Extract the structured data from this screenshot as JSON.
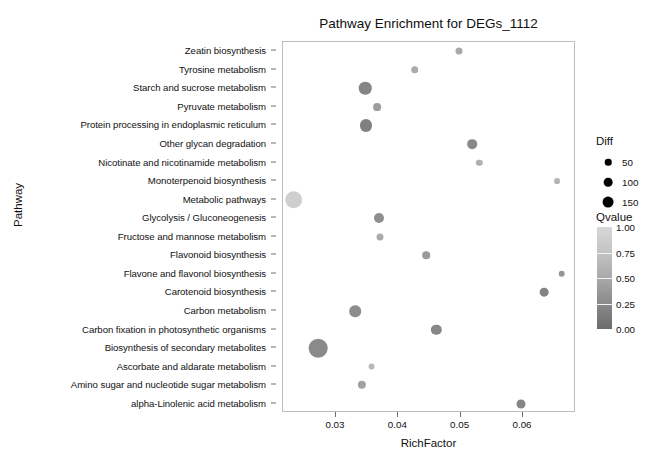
{
  "chart_data": {
    "type": "scatter",
    "title": "Pathway Enrichment for DEGs_1112",
    "xlabel": "RichFactor",
    "ylabel": "Pathway",
    "xlim": [
      0.0215,
      0.0685
    ],
    "xticks": [
      0.03,
      0.04,
      0.05,
      0.06
    ],
    "xtick_labels": [
      "0.03",
      "0.04",
      "0.05",
      "0.06"
    ],
    "grid": false,
    "legend_position": "right",
    "size_legend": {
      "title": "Diff",
      "breaks": [
        50,
        100,
        150
      ],
      "labels": [
        "50",
        "100",
        "150"
      ]
    },
    "color_legend": {
      "title": "Qvalue",
      "ticks": [
        1.0,
        0.75,
        0.5,
        0.25,
        0.0
      ],
      "tick_labels": [
        "1.00",
        "0.75",
        "0.50",
        "0.25",
        "0.00"
      ],
      "low_color": "#6b6b6b",
      "high_color": "#d8d8d8"
    },
    "categories": [
      "Zeatin biosynthesis",
      "Tyrosine metabolism",
      "Starch and sucrose metabolism",
      "Pyruvate metabolism",
      "Protein processing in endoplasmic reticulum",
      "Other glycan degradation",
      "Nicotinate and nicotinamide metabolism",
      "Monoterpenoid biosynthesis",
      "Metabolic pathways",
      "Glycolysis / Gluconeogenesis",
      "Fructose and mannose metabolism",
      "Flavonoid biosynthesis",
      "Flavone and flavonol biosynthesis",
      "Carotenoid biosynthesis",
      "Carbon metabolism",
      "Carbon fixation in photosynthetic organisms",
      "Biosynthesis of secondary metabolites",
      "Ascorbate and aldarate metabolism",
      "Amino sugar and nucleotide sugar metabolism",
      "alpha-Linolenic acid metabolism"
    ],
    "points": [
      {
        "pathway": "Zeatin biosynthesis",
        "richfactor": 0.0498,
        "diff": 10,
        "qvalue": 0.52,
        "color": "#a8a8a8"
      },
      {
        "pathway": "Tyrosine metabolism",
        "richfactor": 0.0426,
        "diff": 13,
        "qvalue": 0.58,
        "color": "#ababab"
      },
      {
        "pathway": "Starch and sucrose metabolism",
        "richfactor": 0.0347,
        "diff": 55,
        "qvalue": 0.22,
        "color": "#858585"
      },
      {
        "pathway": "Pyruvate metabolism",
        "richfactor": 0.0366,
        "diff": 14,
        "qvalue": 0.45,
        "color": "#9d9d9d"
      },
      {
        "pathway": "Protein processing in endoplasmic reticulum",
        "richfactor": 0.0348,
        "diff": 50,
        "qvalue": 0.18,
        "color": "#808080"
      },
      {
        "pathway": "Other glycan degradation",
        "richfactor": 0.0518,
        "diff": 27,
        "qvalue": 0.25,
        "color": "#888888"
      },
      {
        "pathway": "Nicotinate and nicotinamide metabolism",
        "richfactor": 0.053,
        "diff": 7,
        "qvalue": 0.6,
        "color": "#b0b0b0"
      },
      {
        "pathway": "Monoterpenoid biosynthesis",
        "richfactor": 0.0654,
        "diff": 5,
        "qvalue": 0.65,
        "color": "#b5b5b5"
      },
      {
        "pathway": "Metabolic pathways",
        "richfactor": 0.0232,
        "diff": 130,
        "qvalue": 0.88,
        "color": "#cfcfcf"
      },
      {
        "pathway": "Glycolysis / Gluconeogenesis",
        "richfactor": 0.0369,
        "diff": 30,
        "qvalue": 0.3,
        "color": "#8e8e8e"
      },
      {
        "pathway": "Fructose and mannose metabolism",
        "richfactor": 0.037,
        "diff": 10,
        "qvalue": 0.55,
        "color": "#aaaaaa"
      },
      {
        "pathway": "Flavonoid biosynthesis",
        "richfactor": 0.0445,
        "diff": 13,
        "qvalue": 0.42,
        "color": "#9a9a9a"
      },
      {
        "pathway": "Flavone and flavonol biosynthesis",
        "richfactor": 0.0662,
        "diff": 8,
        "qvalue": 0.38,
        "color": "#959595"
      },
      {
        "pathway": "Carotenoid biosynthesis",
        "richfactor": 0.0634,
        "diff": 20,
        "qvalue": 0.2,
        "color": "#838383"
      },
      {
        "pathway": "Carbon metabolism",
        "richfactor": 0.0331,
        "diff": 45,
        "qvalue": 0.28,
        "color": "#8c8c8c"
      },
      {
        "pathway": "Carbon fixation in photosynthetic organisms",
        "richfactor": 0.0461,
        "diff": 33,
        "qvalue": 0.24,
        "color": "#878787"
      },
      {
        "pathway": "Biosynthesis of secondary metabolites",
        "richfactor": 0.0271,
        "diff": 150,
        "qvalue": 0.26,
        "color": "#8a8a8a"
      },
      {
        "pathway": "Ascorbate and aldarate metabolism",
        "richfactor": 0.0357,
        "diff": 9,
        "qvalue": 0.68,
        "color": "#b8b8b8"
      },
      {
        "pathway": "Amino sugar and nucleotide sugar metabolism",
        "richfactor": 0.0342,
        "diff": 17,
        "qvalue": 0.5,
        "color": "#a2a2a2"
      },
      {
        "pathway": "alpha-Linolenic acid metabolism",
        "richfactor": 0.0597,
        "diff": 22,
        "qvalue": 0.23,
        "color": "#858585"
      }
    ]
  }
}
